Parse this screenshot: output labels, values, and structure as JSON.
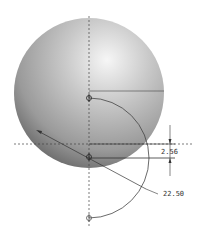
{
  "diagram": {
    "type": "cad-sketch",
    "colors": {
      "background": "#ffffff",
      "sphere_light": "#f2f2f2",
      "sphere_mid": "#b5b5b5",
      "sphere_dark": "#6a6a6a",
      "line": "#333333",
      "centerline": "#444444"
    },
    "dimensions": [
      {
        "id": "linear-offset",
        "label": "2.56"
      },
      {
        "id": "angle",
        "label": "22.50"
      }
    ],
    "points": [
      {
        "id": "pivot-top",
        "icon": "datum-point-icon"
      },
      {
        "id": "pivot-center",
        "icon": "datum-point-icon"
      },
      {
        "id": "pivot-bottom",
        "icon": "datum-point-icon"
      }
    ]
  }
}
